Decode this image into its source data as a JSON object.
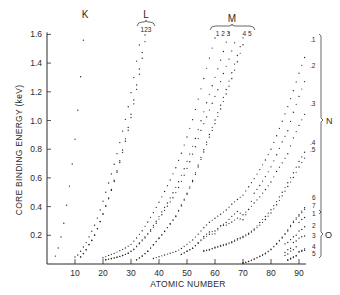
{
  "chart_data": {
    "type": "scatter",
    "title": "",
    "xlabel": "ATOMIC NUMBER",
    "ylabel": "CORE BINDING ENERGY (keV)",
    "xlim": [
      0,
      94
    ],
    "ylim": [
      0,
      1.65
    ],
    "xticks": [
      10,
      20,
      30,
      40,
      50,
      60,
      70,
      80,
      90
    ],
    "yticks": [
      0.2,
      0.4,
      0.6,
      0.8,
      1.0,
      1.2,
      1.4,
      1.6
    ],
    "grid": false,
    "shell_labels": {
      "top": [
        {
          "label": "K",
          "subs": ""
        },
        {
          "label": "L",
          "subs": "123"
        },
        {
          "label": "M",
          "subs_left": "1 2 3",
          "subs_right": "4 5"
        }
      ],
      "right": [
        {
          "label": "N",
          "subs": [
            "1",
            "2",
            "3",
            "4",
            "5",
            "6",
            "7"
          ]
        },
        {
          "label": "O",
          "subs": [
            "1",
            "2",
            "3",
            "4",
            "5"
          ]
        }
      ]
    },
    "series": [
      {
        "name": "K",
        "x": [
          3,
          4,
          5,
          6,
          7,
          8,
          9,
          10,
          11,
          12,
          13
        ],
        "y": [
          0.055,
          0.111,
          0.188,
          0.284,
          0.41,
          0.543,
          0.697,
          0.87,
          1.072,
          1.305,
          1.56
        ]
      },
      {
        "name": "L1",
        "x": [
          10,
          11,
          12,
          13,
          14,
          15,
          16,
          17,
          18,
          19,
          20,
          21,
          22,
          23,
          24,
          25,
          26,
          27,
          28,
          29,
          30,
          31,
          32,
          33,
          34,
          35
        ],
        "y": [
          0.049,
          0.063,
          0.089,
          0.118,
          0.149,
          0.189,
          0.229,
          0.27,
          0.32,
          0.377,
          0.438,
          0.5,
          0.564,
          0.628,
          0.695,
          0.769,
          0.846,
          0.926,
          1.008,
          1.096,
          1.194,
          1.299,
          1.414,
          1.527,
          1.652,
          1.782
        ]
      },
      {
        "name": "L2",
        "x": [
          12,
          13,
          14,
          15,
          16,
          17,
          18,
          19,
          20,
          21,
          22,
          23,
          24,
          25,
          26,
          27,
          28,
          29,
          30,
          31,
          32,
          33,
          34,
          35,
          36
        ],
        "y": [
          0.05,
          0.073,
          0.1,
          0.136,
          0.165,
          0.202,
          0.248,
          0.297,
          0.35,
          0.407,
          0.461,
          0.52,
          0.584,
          0.65,
          0.72,
          0.794,
          0.872,
          0.952,
          1.044,
          1.143,
          1.248,
          1.359,
          1.474,
          1.596,
          1.727
        ]
      },
      {
        "name": "L3",
        "x": [
          12,
          13,
          14,
          15,
          16,
          17,
          18,
          19,
          20,
          21,
          22,
          23,
          24,
          25,
          26,
          27,
          28,
          29,
          30,
          31,
          32,
          33,
          34,
          35,
          36,
          37
        ],
        "y": [
          0.049,
          0.072,
          0.099,
          0.135,
          0.164,
          0.2,
          0.245,
          0.294,
          0.346,
          0.402,
          0.455,
          0.513,
          0.575,
          0.639,
          0.707,
          0.778,
          0.855,
          0.932,
          1.021,
          1.116,
          1.217,
          1.323,
          1.434,
          1.55,
          1.675,
          1.805
        ]
      },
      {
        "name": "M1",
        "x": [
          20,
          22,
          24,
          26,
          28,
          30,
          32,
          34,
          36,
          38,
          40,
          42,
          44,
          46,
          48,
          50,
          52,
          54,
          56,
          58,
          60,
          62,
          64,
          66,
          68,
          70,
          72,
          74,
          76
        ],
        "y": [
          0.044,
          0.06,
          0.074,
          0.093,
          0.112,
          0.137,
          0.181,
          0.232,
          0.293,
          0.358,
          0.431,
          0.505,
          0.586,
          0.671,
          0.772,
          0.885,
          1.006,
          1.149,
          1.293,
          1.435,
          1.575,
          1.723,
          1.881,
          2.047,
          2.206,
          2.398,
          2.601,
          2.82,
          3.049
        ]
      },
      {
        "name": "M2",
        "x": [
          21,
          23,
          25,
          27,
          29,
          31,
          33,
          35,
          37,
          39,
          41,
          43,
          45,
          47,
          49,
          51,
          53,
          55,
          57,
          59,
          61,
          63,
          65,
          67,
          69,
          71,
          73
        ],
        "y": [
          0.032,
          0.038,
          0.047,
          0.059,
          0.075,
          0.104,
          0.146,
          0.189,
          0.239,
          0.298,
          0.363,
          0.425,
          0.496,
          0.573,
          0.664,
          0.766,
          0.875,
          0.998,
          1.124,
          1.242,
          1.36,
          1.481,
          1.611,
          1.741,
          1.885,
          2.024,
          2.194
        ]
      },
      {
        "name": "M3",
        "x": [
          21,
          23,
          25,
          27,
          29,
          31,
          33,
          35,
          37,
          39,
          41,
          43,
          45,
          47,
          49,
          51,
          53,
          55,
          57,
          59,
          61,
          63,
          65,
          67,
          69,
          71,
          73
        ],
        "y": [
          0.028,
          0.037,
          0.047,
          0.059,
          0.075,
          0.1,
          0.141,
          0.182,
          0.229,
          0.284,
          0.343,
          0.403,
          0.462,
          0.533,
          0.619,
          0.713,
          0.817,
          0.931,
          1.025,
          1.12,
          1.215,
          1.328,
          1.428,
          1.541,
          1.639,
          1.739,
          1.871
        ]
      },
      {
        "name": "M4",
        "x": [
          32,
          34,
          36,
          38,
          40,
          42,
          44,
          46,
          48,
          50,
          52,
          54,
          56,
          58,
          60,
          62,
          64,
          66,
          68,
          70,
          72,
          74,
          76,
          78,
          80,
          82,
          84
        ],
        "y": [
          0.029,
          0.056,
          0.089,
          0.134,
          0.181,
          0.228,
          0.279,
          0.335,
          0.411,
          0.493,
          0.582,
          0.689,
          0.796,
          0.902,
          1.003,
          1.106,
          1.216,
          1.333,
          1.453,
          1.576,
          1.716,
          1.872,
          2.031,
          2.202,
          2.385,
          2.586,
          2.798
        ]
      },
      {
        "name": "M5",
        "x": [
          32,
          34,
          36,
          38,
          40,
          42,
          44,
          46,
          48,
          50,
          52,
          54,
          56,
          58,
          60,
          62,
          64,
          66,
          68,
          70,
          72,
          74,
          76,
          78,
          80,
          82,
          84
        ],
        "y": [
          0.029,
          0.055,
          0.089,
          0.133,
          0.178,
          0.227,
          0.28,
          0.33,
          0.405,
          0.485,
          0.573,
          0.676,
          0.781,
          0.884,
          0.978,
          1.08,
          1.185,
          1.293,
          1.409,
          1.528,
          1.662,
          1.809,
          1.96,
          2.122,
          2.295,
          2.484,
          2.683
        ]
      },
      {
        "name": "N1",
        "x": [
          38,
          40,
          42,
          44,
          46,
          48,
          50,
          52,
          54,
          56,
          58,
          60,
          62,
          64,
          66,
          68,
          70,
          72,
          74,
          76,
          78,
          80,
          82,
          84,
          86,
          88,
          90,
          92
        ],
        "y": [
          0.038,
          0.051,
          0.063,
          0.075,
          0.087,
          0.108,
          0.137,
          0.168,
          0.208,
          0.253,
          0.291,
          0.319,
          0.347,
          0.376,
          0.416,
          0.45,
          0.48,
          0.538,
          0.595,
          0.658,
          0.725,
          0.8,
          0.894,
          0.995,
          1.097,
          1.208,
          1.33,
          1.439
        ]
      },
      {
        "name": "N2",
        "x": [
          48,
          50,
          52,
          54,
          56,
          58,
          60,
          62,
          64,
          66,
          68,
          70,
          72,
          74,
          76,
          78,
          80,
          82,
          84,
          86,
          88,
          90,
          92
        ],
        "y": [
          0.067,
          0.089,
          0.11,
          0.146,
          0.192,
          0.223,
          0.23,
          0.266,
          0.289,
          0.332,
          0.366,
          0.343,
          0.381,
          0.493,
          0.547,
          0.609,
          0.677,
          0.761,
          0.851,
          0.929,
          1.058,
          1.168,
          1.271
        ]
      },
      {
        "name": "N3",
        "x": [
          48,
          50,
          52,
          54,
          56,
          58,
          60,
          62,
          64,
          66,
          68,
          70,
          72,
          74,
          76,
          78,
          80,
          82,
          84,
          86,
          88,
          90,
          92
        ],
        "y": [
          0.067,
          0.089,
          0.11,
          0.146,
          0.18,
          0.207,
          0.21,
          0.266,
          0.271,
          0.293,
          0.32,
          0.308,
          0.38,
          0.425,
          0.468,
          0.519,
          0.571,
          0.645,
          0.705,
          0.768,
          0.879,
          0.966,
          1.043
        ]
      },
      {
        "name": "N4",
        "x": [
          56,
          58,
          60,
          62,
          64,
          66,
          68,
          70,
          72,
          74,
          76,
          78,
          80,
          82,
          84,
          86,
          88,
          90,
          92
        ],
        "y": [
          0.093,
          0.102,
          0.117,
          0.13,
          0.14,
          0.155,
          0.177,
          0.192,
          0.214,
          0.244,
          0.289,
          0.331,
          0.378,
          0.435,
          0.5,
          0.566,
          0.636,
          0.714,
          0.779
        ]
      },
      {
        "name": "N5",
        "x": [
          56,
          58,
          60,
          62,
          64,
          66,
          68,
          70,
          72,
          74,
          76,
          78,
          80,
          82,
          84,
          86,
          88,
          90,
          92
        ],
        "y": [
          0.089,
          0.098,
          0.112,
          0.123,
          0.134,
          0.148,
          0.168,
          0.185,
          0.207,
          0.236,
          0.271,
          0.31,
          0.356,
          0.413,
          0.475,
          0.54,
          0.603,
          0.676,
          0.738
        ]
      },
      {
        "name": "N6",
        "x": [
          70,
          72,
          74,
          76,
          78,
          80,
          82,
          84,
          86,
          88,
          90,
          92
        ],
        "y": [
          0.007,
          0.018,
          0.035,
          0.055,
          0.075,
          0.104,
          0.143,
          0.187,
          0.238,
          0.299,
          0.344,
          0.392
        ]
      },
      {
        "name": "N7",
        "x": [
          70,
          72,
          74,
          76,
          78,
          80,
          82,
          84,
          86,
          88,
          90,
          92
        ],
        "y": [
          0.007,
          0.017,
          0.034,
          0.052,
          0.071,
          0.1,
          0.139,
          0.182,
          0.23,
          0.29,
          0.335,
          0.381
        ]
      },
      {
        "name": "O1",
        "x": [
          85,
          86,
          87,
          88,
          89,
          90,
          91,
          92
        ],
        "y": [
          0.14,
          0.15,
          0.17,
          0.19,
          0.2,
          0.29,
          0.31,
          0.324
        ]
      },
      {
        "name": "O2",
        "x": [
          85,
          86,
          87,
          88,
          89,
          90,
          91,
          92
        ],
        "y": [
          0.08,
          0.1,
          0.11,
          0.15,
          0.16,
          0.23,
          0.24,
          0.26
        ]
      },
      {
        "name": "O3",
        "x": [
          85,
          86,
          87,
          88,
          89,
          90,
          91,
          92
        ],
        "y": [
          0.06,
          0.07,
          0.09,
          0.1,
          0.12,
          0.18,
          0.19,
          0.195
        ]
      },
      {
        "name": "O4",
        "x": [
          86,
          87,
          88,
          89,
          90,
          91,
          92
        ],
        "y": [
          0.03,
          0.04,
          0.05,
          0.06,
          0.087,
          0.094,
          0.105
        ]
      },
      {
        "name": "O5",
        "x": [
          86,
          87,
          88,
          89,
          90,
          91,
          92
        ],
        "y": [
          0.025,
          0.035,
          0.045,
          0.055,
          0.083,
          0.089,
          0.095
        ]
      }
    ]
  },
  "labels": {
    "xlabel": "ATOMIC NUMBER",
    "ylabel": "CORE BINDING ENERGY (keV)",
    "K": "K",
    "L": "L",
    "L_subs": "123",
    "M": "M",
    "M_subs_left": "1 2 3",
    "M_subs_right": "4 5",
    "N": "N",
    "O": "O",
    "N_subs": [
      ".1",
      ".2",
      ".3",
      ".4",
      ".5",
      "6",
      "7"
    ],
    "O_subs": [
      "1",
      "2",
      "3",
      "4",
      "5"
    ]
  },
  "colors": {
    "ink": "#2a2a2a",
    "background": "#ffffff"
  }
}
